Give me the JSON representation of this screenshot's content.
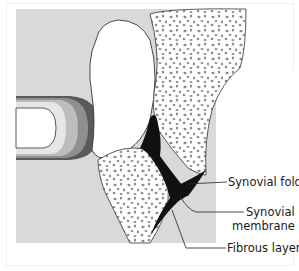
{
  "diagram": {
    "labels": {
      "synovial_fold": "Synovial fold",
      "synovial_membrane_line1": "Synovial",
      "synovial_membrane_line2": "membrane",
      "fibrous_layer": "Fibrous layer"
    },
    "colors": {
      "soft_tissue": "#d9d9d9",
      "cartilage": "#ffffff",
      "bone_spots": "#8c8c8c",
      "membrane": "#111111",
      "band_light": "#e6e6e6",
      "band_mid": "#bdbdbd",
      "band_dark": "#8f8f8f",
      "band_darkest": "#5a5a5a"
    }
  }
}
